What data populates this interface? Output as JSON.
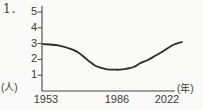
{
  "item_number": "1.",
  "axes": {
    "y_unit_label": "(人)",
    "x_unit_label": "(年)",
    "y_tick_labels": [
      "5",
      "4",
      "3",
      "2",
      "1"
    ],
    "x_tick_labels": [
      "1953",
      "1986",
      "2022"
    ]
  },
  "chart_data": {
    "type": "line",
    "title": "",
    "xlabel": "(年)",
    "ylabel": "(人)",
    "x": [
      1953,
      1960,
      1968,
      1972,
      1976,
      1979,
      1982,
      1985,
      1988,
      1991,
      1994,
      1998,
      2001,
      2005,
      2008,
      2012,
      2015,
      2018,
      2022
    ],
    "values": [
      2.97,
      2.9,
      2.6,
      2.3,
      1.87,
      1.6,
      1.46,
      1.37,
      1.35,
      1.35,
      1.4,
      1.52,
      1.74,
      1.96,
      2.18,
      2.47,
      2.72,
      2.94,
      3.1
    ],
    "xlim": [
      1953,
      2022
    ],
    "ylim": [
      0,
      5
    ],
    "yticks": [
      1,
      2,
      3,
      4,
      5
    ],
    "xticks": [
      1953,
      1986,
      2022
    ],
    "grid": false,
    "legend": false,
    "line_color": "#2b2b2b"
  },
  "colors": {
    "background": "#fafaf8",
    "ink": "#3a3a3a",
    "axis": "#474747"
  }
}
